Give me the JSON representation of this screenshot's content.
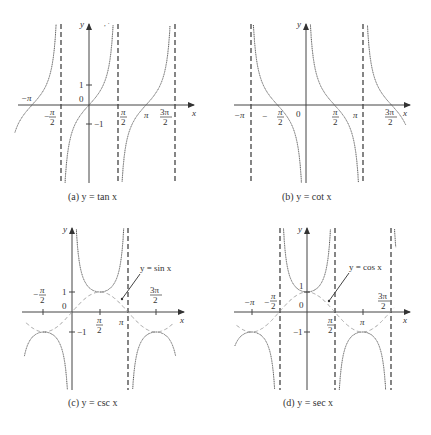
{
  "chart_data": [
    {
      "type": "line",
      "id": "a",
      "title": "(a) y = tan x",
      "caption_prefix": "(a) ",
      "function": "tan",
      "xlabel": "x",
      "ylabel": "y",
      "x_ticks": [
        "−π",
        "−π/2",
        "π/2",
        "π",
        "3π/2"
      ],
      "y_ticks": [
        "1",
        "0",
        "−1"
      ],
      "asymptotes": [
        "−π/2",
        "π/2",
        "3π/2"
      ],
      "xlim": [
        "-1.1π",
        "1.75π"
      ],
      "grid": false,
      "legend": null
    },
    {
      "type": "line",
      "id": "b",
      "title": "(b) y = cot x",
      "function": "cot",
      "xlabel": "x",
      "ylabel": "y",
      "x_ticks": [
        "−π",
        "−π/2",
        "0",
        "π/2",
        "π",
        "3π/2"
      ],
      "y_ticks": [],
      "asymptotes": [
        "−π",
        "0",
        "π"
      ],
      "grid": false,
      "legend": null
    },
    {
      "type": "line",
      "id": "c",
      "title": "(c) y = csc x",
      "function": "csc",
      "reference_curve": "y = sin x",
      "xlabel": "x",
      "ylabel": "y",
      "x_ticks": [
        "−π/2",
        "π/2",
        "π",
        "3π/2"
      ],
      "y_ticks": [
        "1",
        "0",
        "−1"
      ],
      "asymptotes": [
        "π"
      ],
      "annotation": "y = sin x",
      "grid": false
    },
    {
      "type": "line",
      "id": "d",
      "title": "(d) y = sec x",
      "function": "sec",
      "reference_curve": "y = cos x",
      "xlabel": "x",
      "ylabel": "y",
      "x_ticks": [
        "−π",
        "−π/2",
        "π/2",
        "π",
        "3π/2"
      ],
      "y_ticks": [
        "1",
        "0",
        "−1"
      ],
      "asymptotes": [
        "−π/2",
        "π/2",
        "3π/2"
      ],
      "annotation": "y = cos x",
      "grid": false
    }
  ],
  "labels": {
    "x": "x",
    "y": "y",
    "zero": "0",
    "one": "1",
    "neg_one": "−1",
    "pi": "π",
    "neg_pi": "−π",
    "minus": "−",
    "two": "2",
    "three_pi": "3π",
    "sin_annot": "y = sin x",
    "cos_annot": "y = cos x"
  },
  "captions": {
    "a": "(a) y = tan x",
    "b": "(b) y = cot x",
    "c": "(c) y = csc x",
    "d": "(d) y = sec x"
  }
}
